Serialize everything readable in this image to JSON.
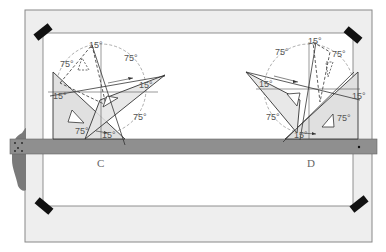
{
  "figure": {
    "colors": {
      "board_frame": "#eeeeee",
      "board_outline": "#888888",
      "paper": "#ffffff",
      "tape": "#111111",
      "t_square": "#8f8f8f",
      "t_square_head": "#7a7a7a",
      "triangle_fill": "#e2e2e2",
      "line": "#333333",
      "label": "#555555"
    }
  },
  "panels": [
    {
      "id": "C",
      "label": "C",
      "angles": [
        "15°",
        "75°",
        "75°",
        "15°",
        "75°",
        "15°",
        "75°",
        "15°"
      ]
    },
    {
      "id": "D",
      "label": "D",
      "angles": [
        "15°",
        "75°",
        "75°",
        "15°",
        "5°",
        "75°",
        "75°",
        "15°"
      ]
    }
  ],
  "labels": {
    "c_top15": "15°",
    "c_top_left75": "75°",
    "c_top_right75": "75°",
    "c_left15": "15°",
    "c_right15": "15°",
    "c_right75": "75°",
    "c_bottom75": "75°",
    "c_bottom15": "15°",
    "d_top15": "15°",
    "d_top_left75": "75°",
    "d_top_right75": "75°",
    "d_left15": "15°",
    "d_right15": "15°",
    "d_bottom_left75": "75°",
    "d_right75": "75°",
    "d_bottom15": "15°",
    "panel_c": "C",
    "panel_d": "D"
  }
}
